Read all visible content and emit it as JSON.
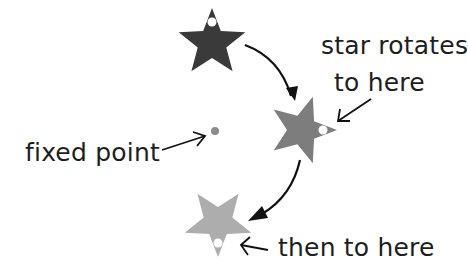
{
  "diagram": {
    "type": "rotation",
    "labels": {
      "fixed_point": "fixed point",
      "rotates_line1": "star rotates",
      "rotates_line2": "to here",
      "then": "then to here"
    },
    "fixed_point": {
      "x": 215,
      "y": 131,
      "color": "#8c8c8c"
    },
    "stars": [
      {
        "name": "original",
        "cx": 212,
        "cy": 43,
        "rotation": 0,
        "color": "#3a3a3a"
      },
      {
        "name": "rotated-90",
        "cx": 302,
        "cy": 130,
        "rotation": 90,
        "color": "#7d7d7d"
      },
      {
        "name": "rotated-180",
        "cx": 218,
        "cy": 222,
        "rotation": 180,
        "color": "#adadad"
      }
    ],
    "arrow_color": "#111111"
  }
}
